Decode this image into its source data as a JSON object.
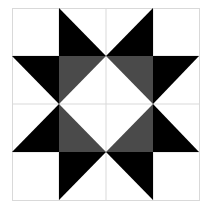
{
  "diagram": {
    "type": "quilt-block",
    "pattern": "ohio-star",
    "grid": {
      "rows": 4,
      "cols": 4,
      "x0": 12,
      "y0": 8,
      "x1": 199,
      "y1": 200
    },
    "colors": {
      "background": "#ffffff",
      "grid_line": "#d9d9d9",
      "star_point": "#000000",
      "center_triangle": "#4a4a4a"
    }
  }
}
